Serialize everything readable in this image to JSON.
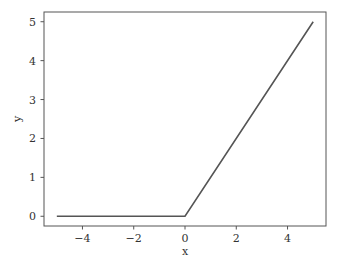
{
  "chart_data": {
    "type": "line",
    "title": "",
    "xlabel": "x",
    "ylabel": "y",
    "xlim": [
      -5.5,
      5.5
    ],
    "ylim": [
      -0.25,
      5.25
    ],
    "xticks": [
      -4,
      -2,
      0,
      2,
      4
    ],
    "xtick_labels": [
      "−4",
      "−2",
      "0",
      "2",
      "4"
    ],
    "yticks": [
      0,
      1,
      2,
      3,
      4,
      5
    ],
    "ytick_labels": [
      "0",
      "1",
      "2",
      "3",
      "4",
      "5"
    ],
    "grid": false,
    "legend": null,
    "series": [
      {
        "name": "ReLU",
        "color": "#555555",
        "x": [
          -5,
          0,
          5
        ],
        "y": [
          0,
          0,
          5
        ]
      }
    ]
  }
}
